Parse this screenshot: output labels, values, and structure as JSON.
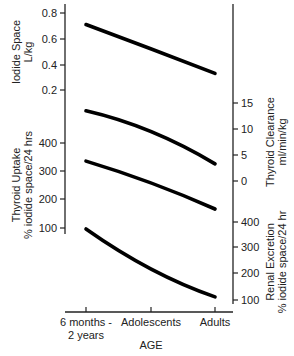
{
  "chart_data": {
    "type": "line",
    "title": "",
    "xlabel": "AGE",
    "categories": [
      "6 months - 2 years",
      "Adolescents",
      "Adults"
    ],
    "category_lines": [
      [
        "6 months -",
        "2 years"
      ],
      [
        "Adolescents"
      ],
      [
        "Adults"
      ]
    ],
    "grid": false,
    "legend": "none",
    "panels": [
      {
        "id": "iodide-space",
        "axis_side": "left",
        "ylabel_lines": [
          "Iodide Space",
          "L/kg"
        ],
        "ticks": [
          0.8,
          0.6,
          0.4,
          0.2
        ],
        "tick_labels": [
          "0.8",
          "0.6",
          "0.4",
          "0.2"
        ],
        "series": {
          "name": "Iodide Space",
          "values": [
            0.71,
            0.52,
            0.33
          ]
        }
      },
      {
        "id": "thyroid-clearance",
        "axis_side": "right",
        "ylabel_lines": [
          "Thyroid Clearance",
          "ml/min/kg"
        ],
        "ticks": [
          15,
          10,
          5,
          0
        ],
        "tick_labels": [
          "15",
          "10",
          "5",
          "0"
        ],
        "series": {
          "name": "Thyroid Clearance",
          "values": [
            13.5,
            9.5,
            3.3
          ]
        }
      },
      {
        "id": "thyroid-uptake",
        "axis_side": "left",
        "ylabel_lines": [
          "Thyroid Uptake",
          "% iodide space/24 hrs"
        ],
        "ticks": [
          400,
          300,
          200,
          100
        ],
        "tick_labels": [
          "400",
          "300",
          "200",
          "100"
        ],
        "series": {
          "name": "Thyroid Uptake",
          "values": [
            336,
            259,
            167
          ]
        }
      },
      {
        "id": "renal-excretion",
        "axis_side": "right",
        "ylabel_lines": [
          "Renal Excretion",
          "% iodide space/24 hr"
        ],
        "ticks": [
          400,
          300,
          200,
          100
        ],
        "tick_labels": [
          "400",
          "300",
          "200",
          "100"
        ],
        "series": {
          "name": "Renal Excretion",
          "values": [
            373,
            219,
            112
          ]
        }
      }
    ]
  }
}
